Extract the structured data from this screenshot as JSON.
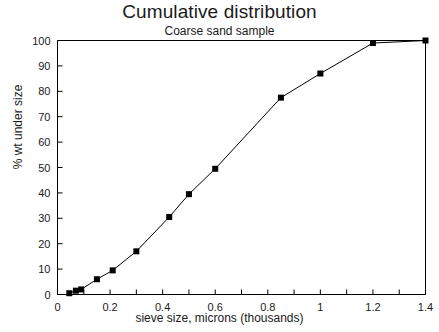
{
  "chart_data": {
    "type": "line",
    "title": "Cumulative distribution",
    "subtitle": "Coarse sand sample",
    "xlabel": "sieve size, microns   (thousands)",
    "ylabel": "% wt under size",
    "xlim": [
      0,
      1.4
    ],
    "ylim": [
      0,
      100
    ],
    "xticks": [
      0,
      0.2,
      0.4,
      0.6,
      0.8,
      1,
      1.2,
      1.4
    ],
    "xtick_labels": [
      "0",
      "0.2",
      "0.4",
      "0.6",
      "0.8",
      "1",
      "1.2",
      "1.4"
    ],
    "xminor_step": 0.1,
    "yticks": [
      0,
      10,
      20,
      30,
      40,
      50,
      60,
      70,
      80,
      90,
      100
    ],
    "ytick_labels": [
      "0",
      "10",
      "20",
      "30",
      "40",
      "50",
      "60",
      "70",
      "80",
      "90",
      "100"
    ],
    "grid": false,
    "legend": null,
    "marker": "square",
    "line_color": "#000000",
    "marker_color": "#000000",
    "x": [
      0.045,
      0.07,
      0.09,
      0.15,
      0.21,
      0.3,
      0.425,
      0.5,
      0.6,
      0.85,
      1.0,
      1.2,
      1.4
    ],
    "values": [
      0.5,
      1.5,
      2,
      6,
      9.5,
      17,
      30.5,
      39.5,
      49.5,
      77.5,
      87,
      99,
      100
    ],
    "series": [
      {
        "name": "Coarse sand sample",
        "points": [
          {
            "x": 0.045,
            "y": 0.5
          },
          {
            "x": 0.07,
            "y": 1.5
          },
          {
            "x": 0.09,
            "y": 2
          },
          {
            "x": 0.15,
            "y": 6
          },
          {
            "x": 0.21,
            "y": 9.5
          },
          {
            "x": 0.3,
            "y": 17
          },
          {
            "x": 0.425,
            "y": 30.5
          },
          {
            "x": 0.5,
            "y": 39.5
          },
          {
            "x": 0.6,
            "y": 49.5
          },
          {
            "x": 0.85,
            "y": 77.5
          },
          {
            "x": 1.0,
            "y": 87
          },
          {
            "x": 1.2,
            "y": 99
          },
          {
            "x": 1.4,
            "y": 100
          }
        ]
      }
    ]
  }
}
